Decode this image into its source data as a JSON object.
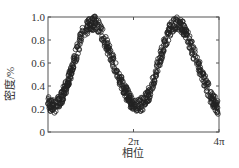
{
  "chart_data": {
    "type": "scatter",
    "title": "",
    "xlabel": "相位",
    "ylabel": "密度/%",
    "xlim": [
      0,
      12.566
    ],
    "ylim": [
      0,
      1.0
    ],
    "xticks": [
      {
        "value": 6.283,
        "label": "2π"
      },
      {
        "value": 12.566,
        "label": "4π"
      }
    ],
    "yticks": [
      {
        "value": 0,
        "label": "0"
      },
      {
        "value": 0.2,
        "label": "0.2"
      },
      {
        "value": 0.4,
        "label": "0.4"
      },
      {
        "value": 0.6,
        "label": "0.6"
      },
      {
        "value": 0.8,
        "label": "0.8"
      },
      {
        "value": 1.0,
        "label": "1.0"
      }
    ],
    "grid": false,
    "legend": null,
    "series": [
      {
        "name": "measured",
        "marker": "open-circle",
        "description": "dense noisy sinusoid, ~period 2π, min ~0.22, max ~0.95",
        "x": [
          0,
          0.5,
          1.0,
          1.5,
          2.0,
          2.5,
          3.0,
          3.5,
          4.0,
          4.5,
          5.0,
          5.5,
          6.0,
          6.5,
          7.0,
          7.5,
          8.0,
          8.5,
          9.0,
          9.5,
          10.0,
          10.5,
          11.0,
          11.5,
          12.0,
          12.566
        ],
        "y": [
          0.25,
          0.22,
          0.3,
          0.45,
          0.65,
          0.85,
          0.93,
          0.95,
          0.85,
          0.7,
          0.55,
          0.4,
          0.28,
          0.22,
          0.25,
          0.35,
          0.55,
          0.75,
          0.9,
          0.95,
          0.9,
          0.75,
          0.6,
          0.45,
          0.3,
          0.2
        ]
      }
    ]
  }
}
